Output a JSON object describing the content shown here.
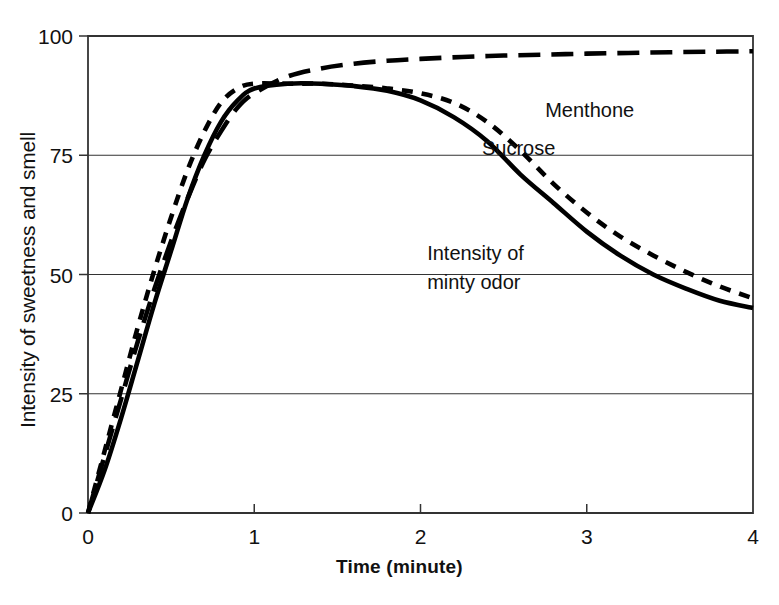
{
  "chart_data": {
    "type": "line",
    "title": "",
    "xlabel": "Time (minute)",
    "ylabel": "Intensity of sweetness and smell",
    "xlim": [
      0,
      4
    ],
    "ylim": [
      0,
      100
    ],
    "xticks": [
      "0",
      "1",
      "2",
      "3",
      "4"
    ],
    "yticks": [
      "0",
      "25",
      "50",
      "75",
      "100"
    ],
    "grid": "horizontal gridlines at 25, 50, 75, 100",
    "legend": "inline annotations on plot",
    "series": [
      {
        "name": "Menthone",
        "style": "long-dash",
        "color": "#000000",
        "annotation": "Menthone",
        "x": [
          0,
          0.1,
          0.2,
          0.3,
          0.4,
          0.5,
          0.6,
          0.7,
          0.8,
          0.9,
          1.0,
          1.2,
          1.4,
          1.6,
          1.8,
          2.0,
          2.25,
          2.5,
          2.75,
          3.0,
          3.25,
          3.5,
          3.75,
          4.0
        ],
        "y": [
          0,
          12,
          24,
          36,
          47,
          57,
          66,
          74,
          80,
          85,
          88,
          91.5,
          93.2,
          94.2,
          94.8,
          95.2,
          95.6,
          95.9,
          96.1,
          96.3,
          96.45,
          96.6,
          96.7,
          96.8
        ]
      },
      {
        "name": "Sucrose",
        "style": "short-dash",
        "color": "#000000",
        "annotation": "Sucrose",
        "x": [
          0,
          0.1,
          0.2,
          0.3,
          0.4,
          0.5,
          0.6,
          0.7,
          0.8,
          0.9,
          1.0,
          1.2,
          1.4,
          1.6,
          1.8,
          2.0,
          2.2,
          2.4,
          2.6,
          2.8,
          3.0,
          3.2,
          3.4,
          3.6,
          3.8,
          4.0
        ],
        "y": [
          0,
          13,
          26,
          39,
          51,
          62,
          72,
          80,
          86,
          89,
          90,
          90,
          90,
          89.6,
          89,
          88,
          86,
          82,
          76,
          69,
          63,
          58,
          54,
          50.5,
          47.5,
          45
        ]
      },
      {
        "name": "Intensity of minty odor",
        "style": "solid",
        "color": "#000000",
        "annotation": "Intensity of\nminty odor",
        "x": [
          0,
          0.1,
          0.2,
          0.3,
          0.4,
          0.5,
          0.6,
          0.7,
          0.8,
          0.9,
          1.0,
          1.2,
          1.4,
          1.6,
          1.8,
          2.0,
          2.2,
          2.4,
          2.6,
          2.8,
          3.0,
          3.2,
          3.4,
          3.6,
          3.8,
          4.0
        ],
        "y": [
          0,
          9,
          20,
          32,
          44,
          55,
          66,
          75,
          82,
          86.5,
          89,
          90,
          90,
          89.5,
          88.5,
          86.5,
          83,
          78,
          71,
          65,
          59,
          54,
          50,
          47,
          44.5,
          43
        ]
      }
    ],
    "annotations": [
      {
        "id": "menthone-label",
        "text": "Menthone",
        "x": 2.75,
        "y": 83
      },
      {
        "id": "sucrose-label",
        "text": "Sucrose",
        "x": 2.37,
        "y": 75
      },
      {
        "id": "minty-label-line1",
        "text": "Intensity of",
        "x": 2.04,
        "y": 53
      },
      {
        "id": "minty-label-line2",
        "text": "minty odor",
        "x": 2.04,
        "y": 47
      }
    ]
  }
}
